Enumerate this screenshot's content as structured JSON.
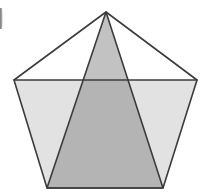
{
  "figure": {
    "title": "Regular pentagon with inscribed shaded triangle",
    "canvas": {
      "width": 214,
      "height": 194,
      "background": "#ffffff"
    },
    "colors": {
      "stroke": "#3c3c3c",
      "pentagon_upper_fill": "#ffffff",
      "pentagon_lower_fill": "#e2e2e2",
      "triangle_upper_fill": "#c2c2c2",
      "triangle_lower_fill": "#b4b4b4",
      "artifact": "#4a4a4a"
    },
    "stroke_width": 1.6,
    "shapes": [
      {
        "name": "pentagon",
        "type": "polygon",
        "sides": 5,
        "label": "Regular pentagon",
        "points": "106,12 197,80 163,188 47,188 14,80",
        "vertices": [
          {
            "name": "apex",
            "x": 106,
            "y": 12
          },
          {
            "name": "right",
            "x": 197,
            "y": 80
          },
          {
            "name": "bottom-right",
            "x": 163,
            "y": 188
          },
          {
            "name": "bottom-left",
            "x": 47,
            "y": 188
          },
          {
            "name": "left",
            "x": 14,
            "y": 80
          }
        ]
      },
      {
        "name": "lower-trapezoid-region",
        "type": "polygon",
        "label": "Pentagon region below the horizontal chord",
        "points": "14,80 197,80 163,188 47,188"
      },
      {
        "name": "upper-triangle-region",
        "type": "polygon",
        "label": "Pentagon region above the horizontal chord",
        "points": "106,12 197,80 14,80"
      },
      {
        "name": "inscribed-triangle",
        "type": "polygon",
        "label": "Shaded inscribed isosceles triangle",
        "points": "106,12 163,188 47,188",
        "vertices": [
          {
            "name": "apex",
            "x": 106,
            "y": 12
          },
          {
            "name": "bottom-right",
            "x": 163,
            "y": 188
          },
          {
            "name": "bottom-left",
            "x": 47,
            "y": 188
          }
        ]
      },
      {
        "name": "horizontal-chord",
        "type": "line",
        "label": "Horizontal chord joining the left and right pentagon vertices",
        "x1": 14,
        "y1": 80,
        "x2": 197,
        "y2": 80
      }
    ]
  }
}
